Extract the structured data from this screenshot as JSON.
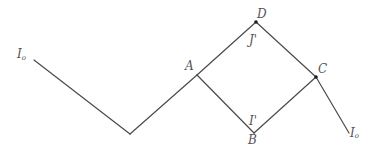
{
  "diagram": {
    "title": "",
    "labels": {
      "input_left": {
        "main": "I",
        "sub": "o"
      },
      "A": "A",
      "D": "D",
      "J_prime": "J'",
      "C": "C",
      "I_prime": "I'",
      "B": "B",
      "output_right": {
        "main": "I",
        "sub": "o"
      }
    },
    "nodes": [
      {
        "id": "input_left",
        "label": "I₀",
        "marked": false
      },
      {
        "id": "valley",
        "label": "",
        "marked": false
      },
      {
        "id": "A",
        "label": "A",
        "marked": false
      },
      {
        "id": "D",
        "label": "D",
        "marked": true
      },
      {
        "id": "C",
        "label": "C",
        "marked": true
      },
      {
        "id": "B",
        "label": "B",
        "marked": false
      },
      {
        "id": "output_right",
        "label": "I₀",
        "marked": false
      }
    ],
    "edges": [
      {
        "from": "input_left",
        "to": "valley"
      },
      {
        "from": "valley",
        "to": "A"
      },
      {
        "from": "A",
        "to": "D",
        "current_label": "J'"
      },
      {
        "from": "D",
        "to": "C"
      },
      {
        "from": "A",
        "to": "B"
      },
      {
        "from": "B",
        "to": "C",
        "current_label": "I'"
      },
      {
        "from": "C",
        "to": "output_right"
      }
    ],
    "colors": {
      "line": "#4a4a4a",
      "dot": "#1a1a1a",
      "text": "#555555",
      "background": "#ffffff"
    }
  }
}
